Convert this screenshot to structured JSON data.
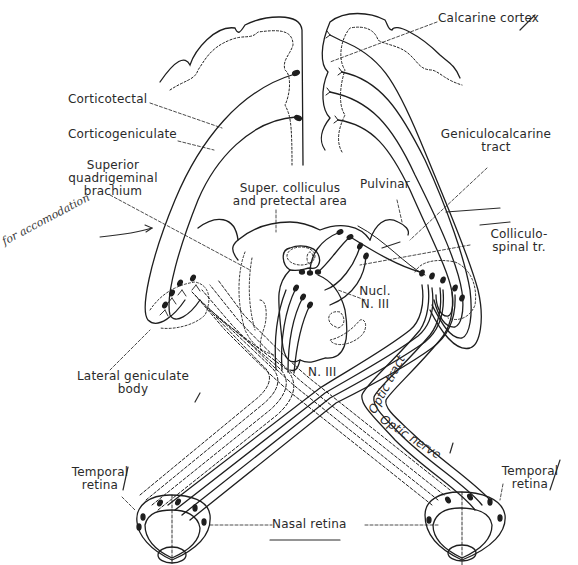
{
  "diagram": {
    "title": "",
    "labels": {
      "calcarine_cortex": "Calcarine cortex",
      "corticotectal": "Corticotectal",
      "corticogeniculate": "Corticogeniculate",
      "geniculocalcarine_tract_line1": "Geniculocalcarine",
      "geniculocalcarine_tract_line2": "tract",
      "superior_quadrigeminal_brachium_line1": "Superior",
      "superior_quadrigeminal_brachium_line2": "quadrigeminal",
      "superior_quadrigeminal_brachium_line3": "brachium",
      "super_colliculus_line1": "Super. colliculus",
      "super_colliculus_line2": "and pretectal area",
      "pulvinar": "Pulvinar",
      "colliculospinal_line1": "Colliculo-",
      "colliculospinal_line2": "spinal tr.",
      "handwritten_note": "for accomodation",
      "nucl_n3_line1": "Nucl.",
      "nucl_n3_line2": "N. III",
      "n3": "N. III",
      "lateral_geniculate_line1": "Lateral geniculate",
      "lateral_geniculate_line2": "body",
      "optic_tract": "Optic tract",
      "optic_nerve": "Optic nerve",
      "temporal_retina_left_line1": "Temporal",
      "temporal_retina_left_line2": "retina",
      "temporal_retina_right_line1": "Temporal",
      "temporal_retina_right_line2": "retina",
      "nasal_retina": "Nasal retina"
    },
    "colors": {
      "ink": "#1e1e1e",
      "label": "#2a2a2a",
      "background": "#ffffff"
    }
  }
}
